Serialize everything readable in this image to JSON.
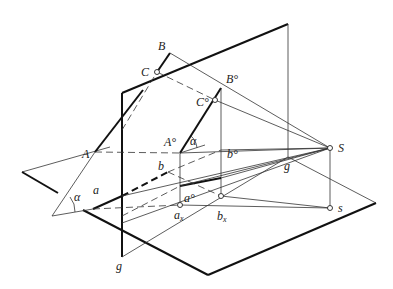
{
  "diagram": {
    "type": "perspective-projection-construction",
    "labels": {
      "B": "B",
      "C": "C",
      "A": "A",
      "B0": "B°",
      "C0": "C°",
      "A0": "A°",
      "alpha_upper": "α",
      "alpha_lower": "α",
      "b0": "b°",
      "b": "b",
      "a": "a",
      "a0": "a°",
      "ax_main": "a",
      "ax_sub": "x",
      "bx_main": "b",
      "bx_sub": "x",
      "S": "S",
      "s": "s",
      "g_right": "g",
      "g_bottom": "g"
    },
    "points": {
      "B": [
        170,
        53
      ],
      "C": [
        157,
        72
      ],
      "A": [
        95,
        152
      ],
      "B0": [
        221,
        88
      ],
      "C0": [
        215,
        100
      ],
      "A0": [
        180,
        153
      ],
      "b0": [
        221,
        150
      ],
      "b": [
        168,
        172
      ],
      "a": [
        93,
        209
      ],
      "a0": [
        180,
        186
      ],
      "ax": [
        180,
        205
      ],
      "bx": [
        221,
        196
      ],
      "S": [
        330,
        148
      ],
      "s": [
        330,
        208
      ],
      "g": [
        288,
        157
      ]
    }
  }
}
